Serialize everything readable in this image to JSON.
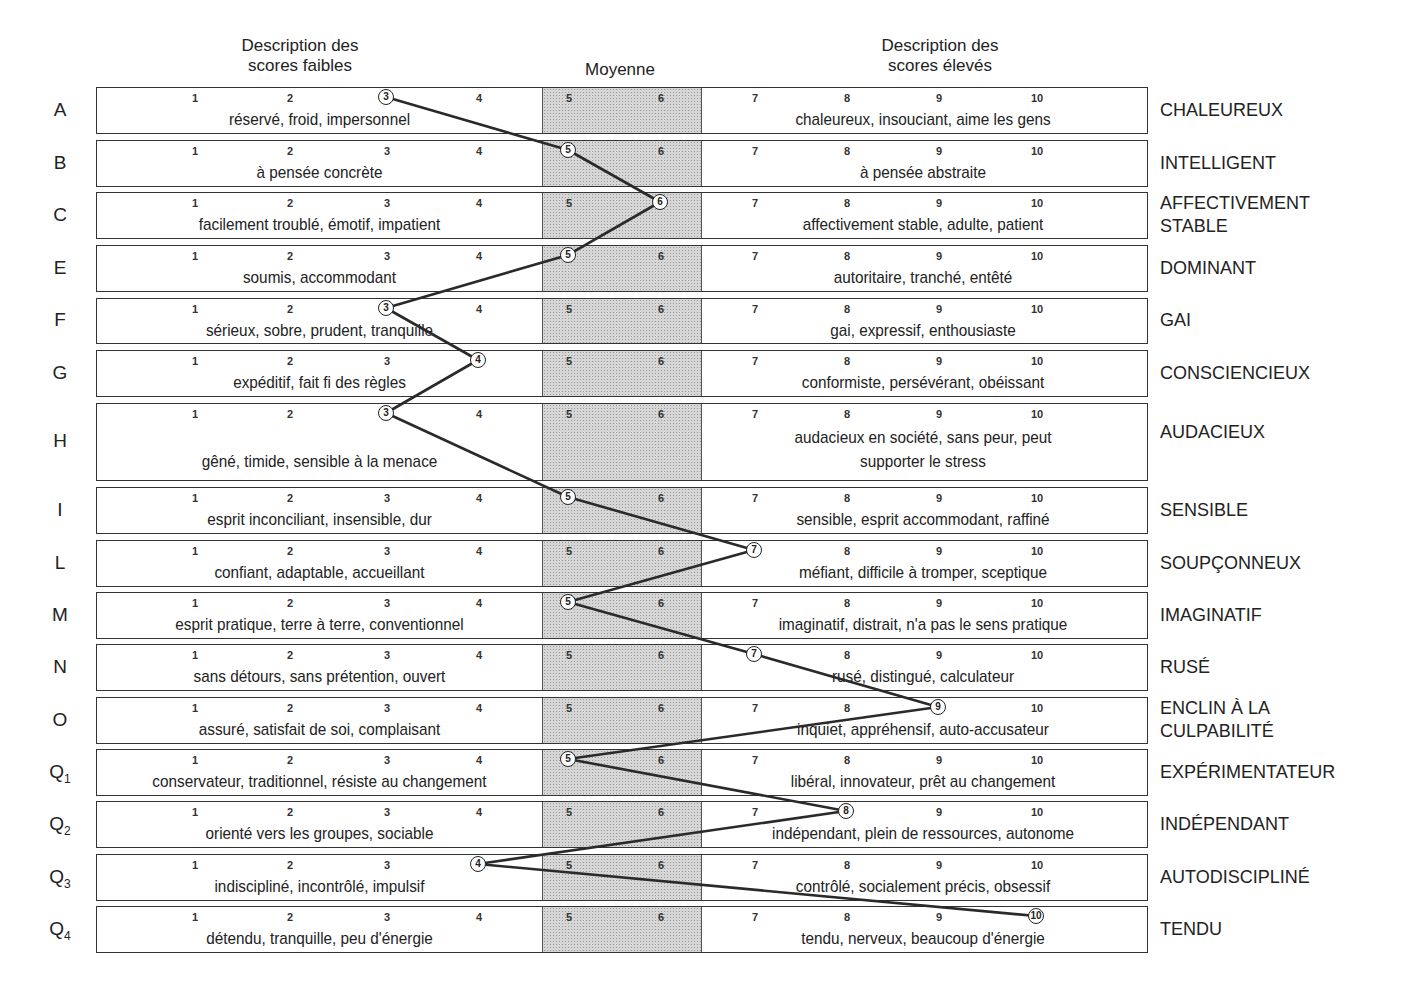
{
  "headers": {
    "low": "Description des scores faibles",
    "low_line1": "Description des",
    "low_line2": "scores faibles",
    "average": "Moyenne",
    "high_line1": "Description des",
    "high_line2": "scores élevés"
  },
  "scale": [
    "1",
    "2",
    "3",
    "4",
    "5",
    "6",
    "7",
    "8",
    "9",
    "10"
  ],
  "colors": {
    "line": "#2a2a2a",
    "band": "#d6d6d6",
    "border": "#333333"
  },
  "chart_data": {
    "type": "line",
    "xlabel": "Score (sten)",
    "ylabel": "Factor",
    "xlim": [
      1,
      10
    ],
    "average_band": [
      5,
      6
    ],
    "categories": [
      "A",
      "B",
      "C",
      "E",
      "F",
      "G",
      "H",
      "I",
      "L",
      "M",
      "N",
      "O",
      "Q1",
      "Q2",
      "Q3",
      "Q4"
    ],
    "series": [
      {
        "name": "Profile",
        "values": [
          3,
          5,
          6,
          5,
          3,
          4,
          3,
          5,
          7,
          5,
          7,
          9,
          5,
          8,
          4,
          10
        ]
      }
    ],
    "low_descriptions": [
      "réservé, froid, impersonnel",
      "à pensée concrète",
      "facilement troublé, émotif, impatient",
      "soumis, accommodant",
      "sérieux, sobre, prudent, tranquille",
      "expéditif, fait fi des règles",
      "gêné, timide, sensible à la menace",
      "esprit inconciliant, insensible, dur",
      "confiant, adaptable, accueillant",
      "esprit pratique, terre à terre, conventionnel",
      "sans détours, sans prétention, ouvert",
      "assuré, satisfait de soi, complaisant",
      "conservateur, traditionnel, résiste au changement",
      "orienté vers les groupes, sociable",
      "indiscipliné, incontrôlé, impulsif",
      "détendu, tranquille, peu d'énergie"
    ],
    "high_descriptions": [
      "chaleureux, insouciant, aime les gens",
      "à pensée abstraite",
      "affectivement stable, adulte, patient",
      "autoritaire, tranché, entêté",
      "gai, expressif, enthousiaste",
      "conformiste, persévérant, obéissant",
      "audacieux en société, sans peur, peut supporter le stress",
      "sensible, esprit accommodant, raffiné",
      "méfiant, difficile à tromper, sceptique",
      "imaginatif, distrait, n'a pas le sens pratique",
      "rusé, distingué, calculateur",
      "inquiet, appréhensif, auto-accusateur",
      "libéral, innovateur, prêt au changement",
      "indépendant, plein de ressources, autonome",
      "contrôlé, socialement précis, obsessif",
      "tendu, nerveux, beaucoup d'énergie"
    ],
    "high_labels": [
      "CHALEUREUX",
      "INTELLIGENT",
      "AFFECTIVEMENT STABLE",
      "DOMINANT",
      "GAI",
      "CONSCIENCIEUX",
      "AUDACIEUX",
      "SENSIBLE",
      "SOUPÇONNEUX",
      "IMAGINATIF",
      "RUSÉ",
      "ENCLIN À LA CULPABILITÉ",
      "EXPÉRIMENTATEUR",
      "INDÉPENDANT",
      "AUTODISCIPLINÉ",
      "TENDU"
    ]
  },
  "rows": [
    {
      "factor": "A",
      "sub": "",
      "score": "3",
      "low": "réservé, froid, impersonnel",
      "high": "chaleureux, insouciant, aime les gens",
      "pole1": "CHALEUREUX",
      "pole2": ""
    },
    {
      "factor": "B",
      "sub": "",
      "score": "5",
      "low": "à pensée concrète",
      "high": "à pensée abstraite",
      "pole1": "INTELLIGENT",
      "pole2": ""
    },
    {
      "factor": "C",
      "sub": "",
      "score": "6",
      "low": "facilement troublé, émotif, impatient",
      "high": "affectivement stable, adulte, patient",
      "pole1": "AFFECTIVEMENT",
      "pole2": "STABLE"
    },
    {
      "factor": "E",
      "sub": "",
      "score": "5",
      "low": "soumis, accommodant",
      "high": "autoritaire, tranché, entêté",
      "pole1": "DOMINANT",
      "pole2": ""
    },
    {
      "factor": "F",
      "sub": "",
      "score": "3",
      "low": "sérieux, sobre, prudent, tranquille",
      "high": "gai, expressif, enthousiaste",
      "pole1": "GAI",
      "pole2": ""
    },
    {
      "factor": "G",
      "sub": "",
      "score": "4",
      "low": "expéditif, fait fi des règles",
      "high": "conformiste, persévérant, obéissant",
      "pole1": "CONSCIENCIEUX",
      "pole2": ""
    },
    {
      "factor": "H",
      "sub": "",
      "score": "3",
      "low": "gêné, timide, sensible à la menace",
      "high": "audacieux en société, sans peur, peut",
      "high2": "supporter le stress",
      "pole1": "AUDACIEUX",
      "pole2": ""
    },
    {
      "factor": "I",
      "sub": "",
      "score": "5",
      "low": "esprit inconciliant, insensible, dur",
      "high": "sensible, esprit accommodant, raffiné",
      "pole1": "SENSIBLE",
      "pole2": ""
    },
    {
      "factor": "L",
      "sub": "",
      "score": "7",
      "low": "confiant, adaptable, accueillant",
      "high": "méfiant, difficile à tromper, sceptique",
      "pole1": "SOUPÇONNEUX",
      "pole2": ""
    },
    {
      "factor": "M",
      "sub": "",
      "score": "5",
      "low": "esprit pratique, terre à terre, conventionnel",
      "high": "imaginatif, distrait, n'a pas le sens pratique",
      "pole1": "IMAGINATIF",
      "pole2": ""
    },
    {
      "factor": "N",
      "sub": "",
      "score": "7",
      "low": "sans détours, sans prétention, ouvert",
      "high": "rusé, distingué, calculateur",
      "pole1": "RUSÉ",
      "pole2": ""
    },
    {
      "factor": "O",
      "sub": "",
      "score": "9",
      "low": "assuré, satisfait de soi, complaisant",
      "high": "inquiet, appréhensif, auto-accusateur",
      "pole1": "ENCLIN À LA",
      "pole2": "CULPABILITÉ"
    },
    {
      "factor": "Q",
      "sub": "1",
      "score": "5",
      "low": "conservateur, traditionnel, résiste au changement",
      "high": "libéral, innovateur, prêt au changement",
      "pole1": "EXPÉRIMENTATEUR",
      "pole2": ""
    },
    {
      "factor": "Q",
      "sub": "2",
      "score": "8",
      "low": "orienté vers les groupes, sociable",
      "high": "indépendant, plein de ressources, autonome",
      "pole1": "INDÉPENDANT",
      "pole2": ""
    },
    {
      "factor": "Q",
      "sub": "3",
      "score": "4",
      "low": "indiscipliné, incontrôlé, impulsif",
      "high": "contrôlé, socialement précis, obsessif",
      "pole1": "AUTODISCIPLINÉ",
      "pole2": ""
    },
    {
      "factor": "Q",
      "sub": "4",
      "score": "10",
      "low": "détendu, tranquille, peu d'énergie",
      "high": "tendu, nerveux, beaucoup d'énergie",
      "pole1": "TENDU",
      "pole2": ""
    }
  ]
}
